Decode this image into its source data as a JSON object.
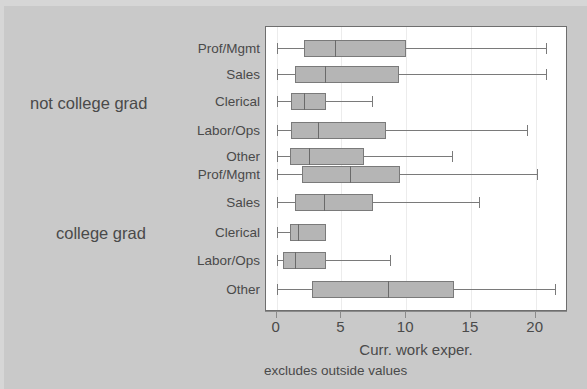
{
  "chart_data": {
    "type": "box",
    "title": "",
    "xlabel": "Curr. work exper.",
    "ylabel": "",
    "note": "excludes outside values",
    "xlim": [
      -0.25,
      23.0
    ],
    "xticks": [
      0,
      5,
      10,
      15,
      20
    ],
    "xticklabels": [
      "0",
      "5",
      "10",
      "15",
      "20"
    ],
    "grid": "vertical-light",
    "legend": "none",
    "orientation": "horizontal",
    "group_labels": [
      "not college grad",
      "college grad"
    ],
    "categories": [
      "Prof/Mgmt",
      "Sales",
      "Clerical",
      "Labor/Ops",
      "Other",
      "Prof/Mgmt",
      "Sales",
      "Clerical",
      "Labor/Ops",
      "Other"
    ],
    "boxes": [
      {
        "label": "Prof/Mgmt",
        "group": "not college grad",
        "whisker_low": 0.1,
        "q1": 2.2,
        "median": 4.6,
        "q3": 10.1,
        "whisker_high": 20.9
      },
      {
        "label": "Sales",
        "group": "not college grad",
        "whisker_low": 0.1,
        "q1": 1.5,
        "median": 3.8,
        "q3": 9.5,
        "whisker_high": 20.9
      },
      {
        "label": "Clerical",
        "group": "not college grad",
        "whisker_low": 0.1,
        "q1": 1.2,
        "median": 2.2,
        "q3": 3.9,
        "whisker_high": 7.4
      },
      {
        "label": "Labor/Ops",
        "group": "not college grad",
        "whisker_low": 0.1,
        "q1": 1.2,
        "median": 3.3,
        "q3": 8.5,
        "whisker_high": 19.4
      },
      {
        "label": "Other",
        "group": "not college grad",
        "whisker_low": 0.1,
        "q1": 1.1,
        "median": 2.6,
        "q3": 6.8,
        "whisker_high": 13.6
      },
      {
        "label": "Prof/Mgmt",
        "group": "college grad",
        "whisker_low": 0.1,
        "q1": 2.0,
        "median": 5.7,
        "q3": 9.6,
        "whisker_high": 20.2
      },
      {
        "label": "Sales",
        "group": "college grad",
        "whisker_low": 0.1,
        "q1": 1.5,
        "median": 3.7,
        "q3": 7.5,
        "whisker_high": 15.7
      },
      {
        "label": "Clerical",
        "group": "college grad",
        "whisker_low": 0.1,
        "q1": 1.1,
        "median": 1.7,
        "q3": 3.9,
        "whisker_high": 3.9
      },
      {
        "label": "Labor/Ops",
        "group": "college grad",
        "whisker_low": 0.1,
        "q1": 0.6,
        "median": 1.5,
        "q3": 3.9,
        "whisker_high": 8.8
      },
      {
        "label": "Other",
        "group": "college grad",
        "whisker_low": 0.1,
        "q1": 2.8,
        "median": 8.7,
        "q3": 13.8,
        "whisker_high": 21.6
      }
    ]
  },
  "colors": {
    "background": "#c9c9c9",
    "plot_background": "#ffffff",
    "box_fill": "#b5b5b5",
    "box_edge": "#7a7a7a",
    "text": "#4a4a4a"
  },
  "layout": {
    "row_centers": [
      48,
      74,
      101,
      130,
      156,
      174,
      202,
      232,
      260,
      289
    ],
    "group_label_y": [
      104,
      234
    ],
    "x_axis_px": {
      "x0": 275.7,
      "px_per_unit": 12.95
    },
    "x_title_center": 416,
    "tick_label_y": 318
  }
}
